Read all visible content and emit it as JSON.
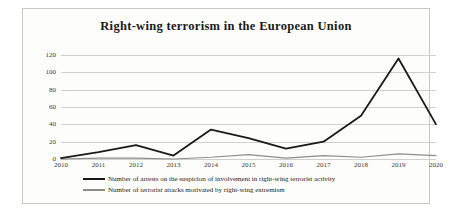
{
  "chart_data": {
    "type": "line",
    "title": "Right-wing terrorism in the European Union",
    "xlabel": "",
    "ylabel": "",
    "ylim": [
      0,
      120
    ],
    "yticks": [
      0,
      20,
      40,
      60,
      80,
      100,
      120
    ],
    "grid": true,
    "legend_position": "bottom",
    "categories": [
      "2010",
      "2011",
      "2012",
      "2013",
      "2014",
      "2015",
      "2016",
      "2017",
      "2018",
      "2019",
      "2020"
    ],
    "series": [
      {
        "name": "Number of arrests on the suspicion of involvement in right-wing terrorist activity",
        "color": "#1a1a1a",
        "values": [
          1,
          8,
          16,
          4,
          34,
          24,
          12,
          20,
          50,
          116,
          40
        ]
      },
      {
        "name": "Number of terrorist attacks motivated by right-wing extremism",
        "color": "#8c8c8c",
        "values": [
          0,
          1,
          1,
          0,
          2,
          5,
          1,
          4,
          2,
          6,
          4
        ]
      }
    ]
  },
  "colors": {
    "series_primary": "#1a1a1a",
    "series_secondary": "#8c8c8c",
    "grid": "#cfcfcb",
    "frame": "#c9c9c4",
    "background": "#fdfdfb"
  }
}
